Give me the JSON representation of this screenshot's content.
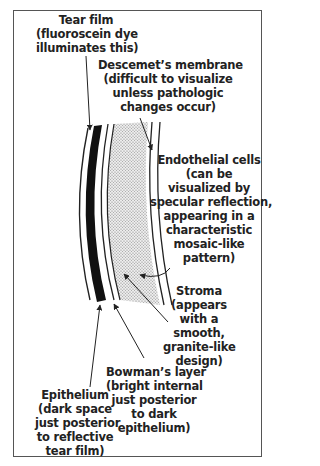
{
  "diagram": {
    "type": "corneal-layers-cross-section",
    "labels": {
      "tear_film": [
        "Tear film",
        "(fluoroscein dye",
        "illuminates this)"
      ],
      "descemet": [
        "Descemet’s membrane",
        "(difficult to visualize",
        "unless pathologic",
        "changes occur)"
      ],
      "endothelial": [
        "Endothelial cells",
        "(can be",
        "visualized by",
        "specular reflection,",
        "appearing in a",
        "characteristic",
        "mosaic-like",
        "pattern)"
      ],
      "stroma": [
        "Stroma",
        "(appears",
        "with a",
        "smooth,",
        "granite-like",
        "design)"
      ],
      "bowman": [
        "Bowman’s layer",
        "(bright internal",
        "just posterior",
        "to dark",
        "epithelium)"
      ],
      "epithelium": [
        "Epithelium",
        "(dark space",
        "just posterior",
        "to reflective",
        "tear film)"
      ]
    },
    "colors": {
      "ink": "#222222",
      "frame": "#555555",
      "stroma_fill": "#d8d8d8",
      "background": "#ffffff"
    }
  }
}
